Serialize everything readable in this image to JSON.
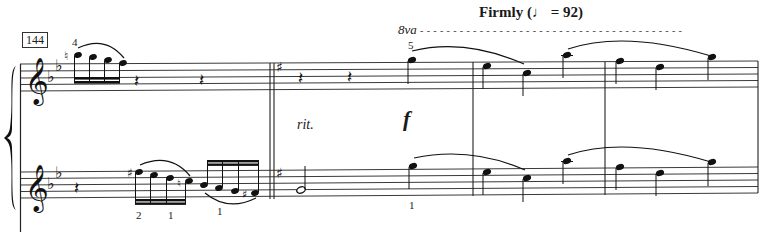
{
  "score": {
    "measure_number": "144",
    "tempo": {
      "text": "Firmly",
      "open_paren": "(",
      "note_symbol": "♩",
      "equals": " = 92)",
      "bpm": 92
    },
    "ottava": {
      "label": "8va",
      "dash_line": "- - - - - - - - - - - - - - - - - - - - - - - - - - - - - - - - - - - - - - - -"
    },
    "expressions": {
      "ritardando": "rit.",
      "dynamic": "f"
    },
    "fingerings": {
      "upper_first": "4",
      "upper_ottava": "5",
      "lower_a": "2",
      "lower_b": "1",
      "lower_c": "1",
      "lower_d": "1"
    },
    "key_signature_initial": "B-flat major (2 flats)",
    "key_signature_change": "G major (1 sharp)",
    "clefs": {
      "upper": "treble",
      "lower": "treble"
    },
    "colors": {
      "ink": "#1a1a1a",
      "staff_line": "#3a3a3a",
      "paper": "#ffffff"
    }
  }
}
